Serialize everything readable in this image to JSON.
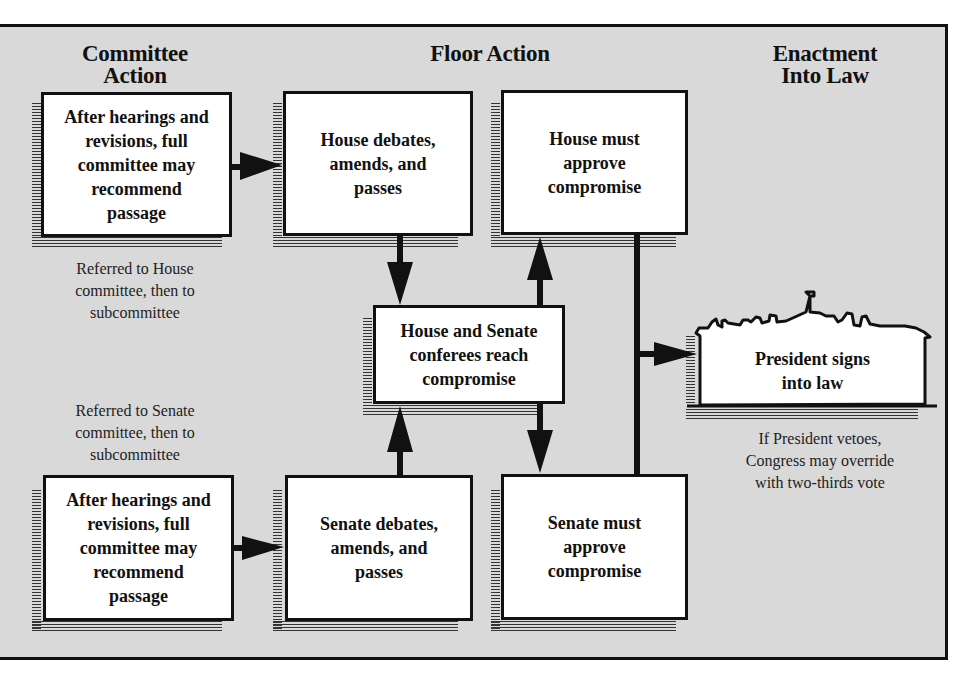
{
  "headings": {
    "committee": "Committee Action",
    "committee_line1": "Committee",
    "committee_line2": "Action",
    "floor": "Floor Action",
    "enactment_line1": "Enactment",
    "enactment_line2": "Into Law"
  },
  "boxes": {
    "house_committee": [
      "After hearings and",
      "revisions, full",
      "committee may",
      "recommend",
      "passage"
    ],
    "house_floor": [
      "House debates,",
      "amends, and",
      "passes"
    ],
    "house_approve": [
      "House must",
      "approve",
      "compromise"
    ],
    "conference": [
      "House and Senate",
      "conferees reach",
      "compromise"
    ],
    "senate_committee": [
      "After hearings and",
      "revisions, full",
      "committee may",
      "recommend",
      "passage"
    ],
    "senate_floor": [
      "Senate debates,",
      "amends, and",
      "passes"
    ],
    "senate_approve": [
      "Senate must",
      "approve",
      "compromise"
    ],
    "president": [
      "President signs",
      "into law"
    ]
  },
  "notes": {
    "house_referral": [
      "Referred to House",
      "committee, then to",
      "subcommittee"
    ],
    "senate_referral": [
      "Referred to Senate",
      "committee, then to",
      "subcommittee"
    ],
    "veto": [
      "If President vetoes,",
      "Congress may override",
      "with two-thirds vote"
    ]
  },
  "colors": {
    "background": "#d9d9d9",
    "box_fill": "#ffffff",
    "ink": "#111111"
  }
}
